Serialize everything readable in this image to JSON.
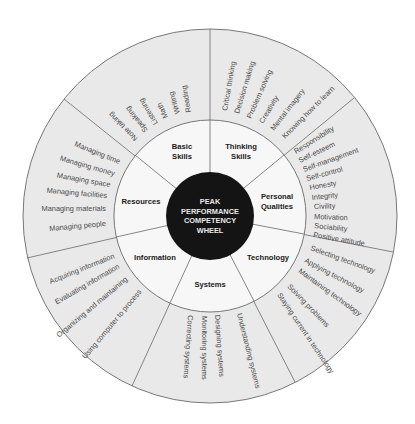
{
  "hub": {
    "lines": [
      "PEAK",
      "PERFORMANCE",
      "COMPETENCY",
      "WHEEL"
    ]
  },
  "colors": {
    "hub_fill": "#141414",
    "middle_ring_fill": "#f7f7f7",
    "outer_ring_fill": "#e9e9e9",
    "line_color": "#6a6a6a",
    "outer_text": "#4a4a4a",
    "ring_text": "#1a1a1a",
    "hub_text": "#e8e8e8"
  },
  "segments": [
    {
      "label_lines": [
        "Basic",
        "Skills"
      ],
      "skills": [
        "Reading",
        "Writing",
        "Math",
        "Listening",
        "Speaking",
        "Note taking"
      ]
    },
    {
      "label_lines": [
        "Thinking",
        "Skills"
      ],
      "skills": [
        "Critical thinking",
        "Decision making",
        "Problem solving",
        "Creativity",
        "Mental imagery",
        "Knowing how to learn"
      ]
    },
    {
      "label_lines": [
        "Personal",
        "Qualities"
      ],
      "skills": [
        "Responsibility",
        "Self-esteem",
        "Self-management",
        "Self-control",
        "Honesty",
        "Integrity",
        "Civility",
        "Motivation",
        "Sociability",
        "Positive attitude"
      ]
    },
    {
      "label_lines": [
        "Technology"
      ],
      "skills": [
        "Selecting technology",
        "Applying technology",
        "Maintaining technology",
        "Solving problems",
        "Staying current in technology"
      ]
    },
    {
      "label_lines": [
        "Systems"
      ],
      "skills": [
        "Understanding systems",
        "Designing systems",
        "Monitoring systems",
        "Correcting systems"
      ]
    },
    {
      "label_lines": [
        "Information"
      ],
      "skills": [
        "Acquiring information",
        "Evaluating information",
        "Organizing and maintaining",
        "Using computer to process"
      ]
    },
    {
      "label_lines": [
        "Resources"
      ],
      "skills": [
        "Managing time",
        "Managing money",
        "Managing space",
        "Managing facilities",
        "Managing materials",
        "Managing people"
      ]
    }
  ]
}
